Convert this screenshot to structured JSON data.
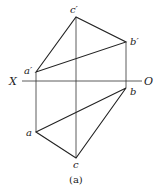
{
  "diagram": {
    "caption": "(a)",
    "axis": {
      "left_label": "X",
      "right_label": "O"
    },
    "points": {
      "a_prime": {
        "label": "a′",
        "x": 36,
        "y": 72
      },
      "b_prime": {
        "label": "b′",
        "x": 126,
        "y": 42
      },
      "c_prime": {
        "label": "c′",
        "x": 76,
        "y": 17
      },
      "a": {
        "label": "a",
        "x": 36,
        "y": 132
      },
      "b": {
        "label": "b",
        "x": 126,
        "y": 88
      },
      "c": {
        "label": "c",
        "x": 76,
        "y": 158
      }
    }
  }
}
